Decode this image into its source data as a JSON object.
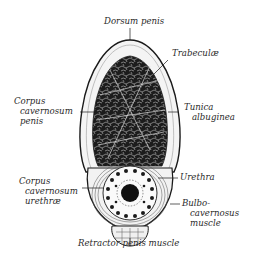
{
  "figure": {
    "kind": "anatomical cross-section",
    "colors": {
      "ink": "#1a1a1a",
      "paper": "#ffffff",
      "tissue_light": "#e8e8e8"
    }
  },
  "labels": {
    "dorsum": "Dorsum penis",
    "trabeculae": "Trabeculæ",
    "cc_penis": [
      "Corpus",
      "cavernosum",
      "penis"
    ],
    "tunica": [
      "Tunica",
      "albuginea"
    ],
    "cc_urethrae": [
      "Corpus",
      "cavernosum",
      "urethræ"
    ],
    "urethra": "Urethra",
    "bulbo": [
      "Bulbo-",
      "cavernosus",
      "muscle"
    ],
    "retractor": "Retractor penis muscle"
  }
}
